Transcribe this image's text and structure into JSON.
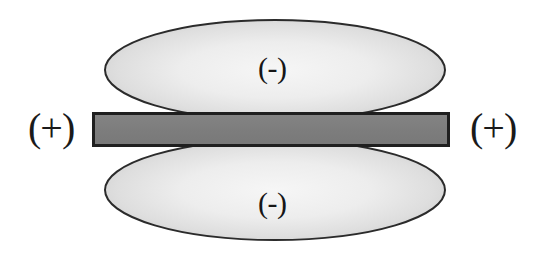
{
  "figure": {
    "background_color": "#ffffff",
    "width": 545,
    "height": 254
  },
  "labels": {
    "positive_left": "(+)",
    "positive_right": "(+)",
    "negative_top": "(-)",
    "negative_bottom": "(-)"
  },
  "shapes": {
    "lobe_top": {
      "name": "upper-lobe",
      "label": "(-)",
      "center_x": 275,
      "center_y": 70,
      "radius_x": 170,
      "radius_y": 50,
      "fill_center_color": "#f2f2f2",
      "fill_edge_color": "#cdcdcd",
      "stroke_color": "#2b2b2b",
      "stroke_width": 2
    },
    "lobe_bottom": {
      "name": "lower-lobe",
      "label": "(-)",
      "center_x": 275,
      "center_y": 190,
      "radius_x": 170,
      "radius_y": 50,
      "fill_center_color": "#f2f2f2",
      "fill_edge_color": "#cdcdcd",
      "stroke_color": "#2b2b2b",
      "stroke_width": 2
    },
    "bar": {
      "name": "central-bar",
      "x": 92,
      "y": 112,
      "width": 358,
      "height": 35,
      "fill_color": "#808080",
      "stroke_color": "#1f1f1f",
      "stroke_width": 3
    }
  },
  "colors": {
    "background": "#ffffff",
    "bar_fill": "#808080",
    "bar_stroke": "#1f1f1f",
    "lobe_fill_light": "#f2f2f2",
    "lobe_fill_dark": "#cdcdcd",
    "lobe_stroke": "#2b2b2b",
    "text": "#1a1a1a"
  }
}
